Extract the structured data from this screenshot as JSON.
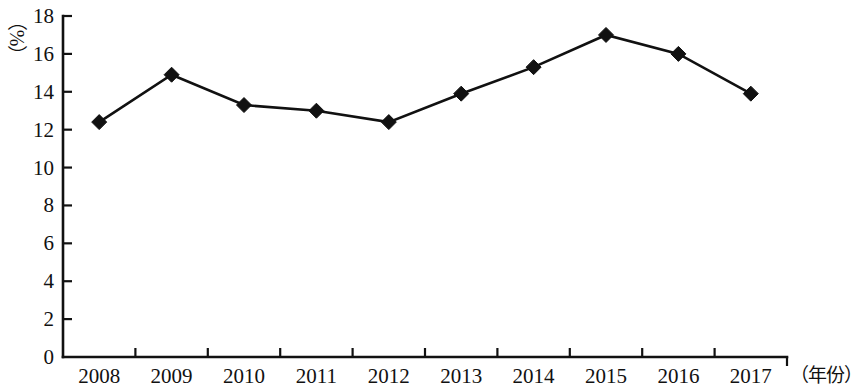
{
  "chart_data": {
    "type": "line",
    "title": "",
    "subtitle": "",
    "xlabel": "（年份）",
    "ylabel": "（%）",
    "categories": [
      "2008",
      "2009",
      "2010",
      "2011",
      "2012",
      "2013",
      "2014",
      "2015",
      "2016",
      "2017"
    ],
    "values": [
      12.4,
      14.9,
      13.3,
      13.0,
      12.4,
      13.9,
      15.3,
      17.0,
      16.0,
      13.9
    ],
    "series": [
      {
        "name": "",
        "values": [
          12.4,
          14.9,
          13.3,
          13.0,
          12.4,
          13.9,
          15.3,
          17.0,
          16.0,
          13.9
        ]
      }
    ],
    "ylim": [
      0,
      18
    ],
    "ytick_labels": [
      "0",
      "2",
      "4",
      "6",
      "8",
      "10",
      "12",
      "14",
      "16",
      "18"
    ],
    "ytick_values": [
      0,
      2,
      4,
      6,
      8,
      10,
      12,
      14,
      16,
      18
    ],
    "grid": false,
    "legend": null,
    "legend_position": "none",
    "marker": "diamond",
    "line_color": "#111111",
    "marker_color": "#111111",
    "background_color": "#ffffff"
  }
}
